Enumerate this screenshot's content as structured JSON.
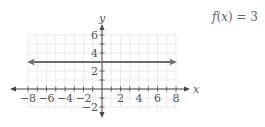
{
  "chart_data": {
    "type": "line",
    "title": "",
    "function_label": "f(x) = 3",
    "xlabel": "x",
    "ylabel": "y",
    "xlim": [
      -8,
      8
    ],
    "ylim": [
      -2,
      6
    ],
    "x_ticks": [
      -8,
      -6,
      -4,
      -2,
      2,
      4,
      6,
      8
    ],
    "y_ticks": [
      -2,
      2,
      4,
      6
    ],
    "grid": true,
    "series": [
      {
        "name": "f(x) = 3",
        "x": [
          -8,
          8
        ],
        "y": [
          3,
          3
        ],
        "arrows": "both",
        "color": "#6e6e6e"
      }
    ]
  },
  "labels": {
    "function": {
      "f": "f",
      "open": "(",
      "x": "x",
      "close": ")",
      "rest": " = 3"
    },
    "x_axis": "x",
    "y_axis": "y",
    "x_tick_labels": [
      "−8",
      "−6",
      "−4",
      "−2",
      "2",
      "4",
      "6",
      "8"
    ],
    "y_tick_labels": [
      "−2",
      "2",
      "4",
      "6"
    ]
  },
  "colors": {
    "grid": "#e4e4e4",
    "axes": "#444444",
    "line": "#6e6e6e",
    "text": "#555555"
  }
}
